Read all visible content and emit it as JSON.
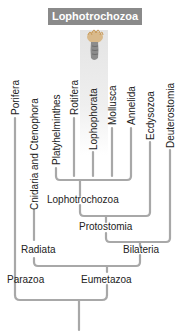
{
  "header": {
    "title": "Lophotrochozoa",
    "color": "#8a8a8a"
  },
  "organism_image": {
    "name": "lophophorate-organism-illustration"
  },
  "taxa": [
    {
      "label": "Porifera"
    },
    {
      "label": "Cnidaria and Ctenophora"
    },
    {
      "label": "Platyhelminthes"
    },
    {
      "label": "Rotifera"
    },
    {
      "label": "Lophophorata"
    },
    {
      "label": "Mollusca"
    },
    {
      "label": "Annelida"
    },
    {
      "label": "Ecdysozoa"
    },
    {
      "label": "Deuterostomia"
    }
  ],
  "clades": {
    "lophotrochozoa": "Lophotrochozoa",
    "protostomia": "Protostomia",
    "bilateria": "Bilateria",
    "radiata": "Radiata",
    "parazoa": "Parazoa",
    "eumetazoa": "Eumetazoa"
  },
  "line_color": "#a8a8a8"
}
